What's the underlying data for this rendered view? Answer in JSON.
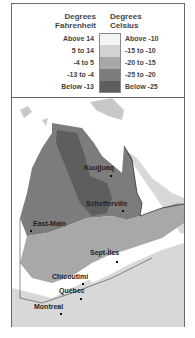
{
  "legend": {
    "fahrenheit_header": "Degrees Fahrenheit",
    "celsius_header": "Degrees Celsius",
    "rows": [
      {
        "fahrenheit": "Above 14",
        "celsius": "Above -10",
        "color": "#f4f4f4"
      },
      {
        "fahrenheit": "5 to 14",
        "celsius": "-15 to -10",
        "color": "#d2d2d2"
      },
      {
        "fahrenheit": "-4 to 5",
        "celsius": "-20 to -15",
        "color": "#a8a8a8"
      },
      {
        "fahrenheit": "-13 to -4",
        "celsius": "-25 to -20",
        "color": "#7c7c7c"
      },
      {
        "fahrenheit": "Below -13",
        "celsius": "Below -25",
        "color": "#5e5e5e"
      }
    ]
  },
  "map": {
    "cities": [
      {
        "name": "Kuujjuaq"
      },
      {
        "name": "Schefferville"
      },
      {
        "name": "East-Main"
      },
      {
        "name": "Sept-Îles"
      },
      {
        "name": "Chicoutimi"
      },
      {
        "name": "Québec"
      },
      {
        "name": "Montreal"
      }
    ]
  }
}
